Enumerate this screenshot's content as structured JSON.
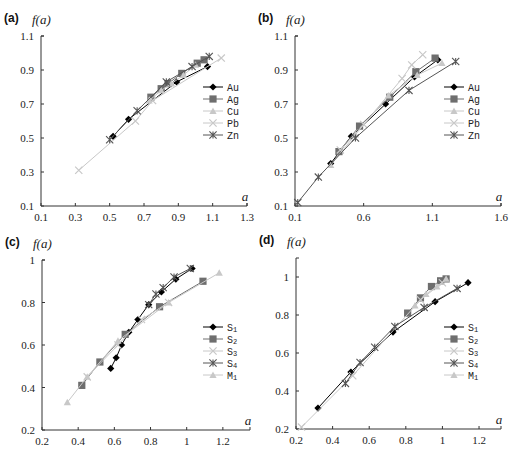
{
  "figure": {
    "panels_count": 4
  },
  "chart_data": [
    {
      "panel": "(a)",
      "type": "line",
      "title": "",
      "xlabel": "a",
      "ylabel": "f(a)",
      "xlim": [
        0.1,
        1.3
      ],
      "ylim": [
        0.1,
        1.1
      ],
      "xticks": [
        "0.1",
        "0.3",
        "0.5",
        "0.7",
        "0.9",
        "1.1",
        "1.3"
      ],
      "yticks": [
        "0.1",
        "0.3",
        "0.5",
        "0.7",
        "0.9",
        "1.1"
      ],
      "grid": false,
      "legend_position": "right-middle",
      "frame": {
        "x0": 41,
        "x1": 247,
        "y0": 206,
        "y1": 36
      },
      "legend": {
        "x": 203,
        "y": 87
      },
      "series": [
        {
          "name": "Au",
          "marker": "diamond",
          "color": "#000000",
          "x": [
            0.52,
            0.61,
            0.89,
            1.07
          ],
          "y": [
            0.51,
            0.61,
            0.83,
            0.92
          ]
        },
        {
          "name": "Ag",
          "marker": "square",
          "color": "#6e6e6e",
          "x": [
            0.74,
            0.8,
            0.84,
            0.92,
            1.01,
            1.05
          ],
          "y": [
            0.74,
            0.79,
            0.82,
            0.88,
            0.94,
            0.96
          ]
        },
        {
          "name": "Cu",
          "marker": "triangle",
          "color": "#c8c8c8",
          "x": [
            0.73,
            0.8,
            0.86,
            0.93,
            1.0
          ],
          "y": [
            0.72,
            0.78,
            0.82,
            0.87,
            0.93
          ]
        },
        {
          "name": "Pb",
          "marker": "x",
          "color": "#c8c8c8",
          "x": [
            0.32,
            0.65,
            0.75,
            1.15
          ],
          "y": [
            0.31,
            0.6,
            0.72,
            0.97
          ]
        },
        {
          "name": "Zn",
          "marker": "star",
          "color": "#555555",
          "x": [
            0.5,
            0.66,
            0.83,
            0.98,
            1.08
          ],
          "y": [
            0.49,
            0.66,
            0.83,
            0.92,
            0.98
          ]
        }
      ]
    },
    {
      "panel": "(b)",
      "type": "line",
      "title": "",
      "xlabel": "a",
      "ylabel": "f(a)",
      "xlim": [
        0.1,
        1.6
      ],
      "ylim": [
        0.1,
        1.1
      ],
      "xticks": [
        "0.1",
        "0.6",
        "1.1",
        "1.6"
      ],
      "yticks": [
        "0.1",
        "0.3",
        "0.5",
        "0.7",
        "0.9",
        "1.1"
      ],
      "grid": false,
      "legend_position": "right-middle",
      "frame": {
        "x0": 295,
        "x1": 501,
        "y0": 206,
        "y1": 36
      },
      "legend": {
        "x": 444,
        "y": 87
      },
      "series": [
        {
          "name": "Au",
          "marker": "diamond",
          "color": "#000000",
          "x": [
            0.36,
            0.51,
            0.76,
            0.97,
            1.14
          ],
          "y": [
            0.35,
            0.51,
            0.7,
            0.86,
            0.96
          ]
        },
        {
          "name": "Ag",
          "marker": "square",
          "color": "#6e6e6e",
          "x": [
            0.42,
            0.57,
            0.79,
            0.98,
            1.12
          ],
          "y": [
            0.42,
            0.57,
            0.74,
            0.89,
            0.97
          ]
        },
        {
          "name": "Cu",
          "marker": "triangle",
          "color": "#c8c8c8",
          "x": [
            0.36,
            0.54,
            0.78,
            0.99,
            1.17
          ],
          "y": [
            0.34,
            0.52,
            0.75,
            0.87,
            0.94
          ]
        },
        {
          "name": "Pb",
          "marker": "x",
          "color": "#c8c8c8",
          "x": [
            0.43,
            0.6,
            0.88,
            0.95,
            1.03
          ],
          "y": [
            0.43,
            0.58,
            0.85,
            0.93,
            0.99
          ]
        },
        {
          "name": "Zn",
          "marker": "star",
          "color": "#555555",
          "x": [
            0.12,
            0.27,
            0.54,
            0.93,
            1.27
          ],
          "y": [
            0.12,
            0.27,
            0.5,
            0.78,
            0.95
          ]
        }
      ]
    },
    {
      "panel": "(c)",
      "type": "line",
      "title": "",
      "xlabel": "a",
      "ylabel": "f(a)",
      "xlim": [
        0.2,
        1.35
      ],
      "ylim": [
        0.2,
        1.0
      ],
      "xticks": [
        "0.2",
        "0.4",
        "0.6",
        "0.8",
        "1",
        "1.2"
      ],
      "yticks": [
        "0.2",
        "0.4",
        "0.6",
        "0.8",
        "1"
      ],
      "grid": false,
      "legend_position": "right-middle",
      "frame": {
        "x0": 42,
        "x1": 250,
        "y0": 430,
        "y1": 260
      },
      "legend": {
        "x": 203,
        "y": 327
      },
      "series": [
        {
          "name": "S1",
          "marker": "diamond",
          "color": "#000000",
          "x": [
            0.58,
            0.61,
            0.64,
            0.68,
            0.73,
            0.79,
            0.86,
            0.94,
            1.03
          ],
          "y": [
            0.49,
            0.54,
            0.6,
            0.66,
            0.72,
            0.79,
            0.85,
            0.91,
            0.96
          ]
        },
        {
          "name": "S2",
          "marker": "square",
          "color": "#6e6e6e",
          "x": [
            0.42,
            0.52,
            0.66,
            0.85,
            1.09
          ],
          "y": [
            0.41,
            0.52,
            0.65,
            0.78,
            0.9
          ]
        },
        {
          "name": "S3",
          "marker": "x",
          "color": "#c8c8c8",
          "x": [
            0.45,
            0.62,
            0.75,
            0.9
          ],
          "y": [
            0.45,
            0.6,
            0.72,
            0.8
          ]
        },
        {
          "name": "S4",
          "marker": "star",
          "color": "#555555",
          "x": [
            0.79,
            0.83,
            0.87,
            0.93,
            1.02
          ],
          "y": [
            0.79,
            0.84,
            0.87,
            0.92,
            0.96
          ]
        },
        {
          "name": "M1",
          "marker": "triangle",
          "color": "#c8c8c8",
          "x": [
            0.34,
            0.45,
            0.62,
            0.9,
            1.18
          ],
          "y": [
            0.33,
            0.45,
            0.62,
            0.8,
            0.94
          ]
        }
      ]
    },
    {
      "panel": "(d)",
      "type": "line",
      "title": "",
      "xlabel": "a",
      "ylabel": "f(a)",
      "xlim": [
        0.2,
        1.32
      ],
      "ylim": [
        0.2,
        1.1
      ],
      "xticks": [
        "0.2",
        "0.4",
        "0.6",
        "0.8",
        "1",
        "1.2"
      ],
      "yticks": [
        "0.2",
        "0.4",
        "0.6",
        "0.8",
        "1"
      ],
      "grid": false,
      "legend_position": "right-middle",
      "frame": {
        "x0": 296,
        "x1": 501,
        "y0": 429,
        "y1": 258
      },
      "legend": {
        "x": 444,
        "y": 327
      },
      "series": [
        {
          "name": "S1",
          "marker": "diamond",
          "color": "#000000",
          "x": [
            0.32,
            0.5,
            0.73,
            0.96,
            1.14
          ],
          "y": [
            0.31,
            0.5,
            0.71,
            0.87,
            0.97
          ]
        },
        {
          "name": "S2",
          "marker": "square",
          "color": "#6e6e6e",
          "x": [
            0.81,
            0.88,
            0.94,
            0.99,
            1.02
          ],
          "y": [
            0.81,
            0.89,
            0.95,
            0.98,
            0.99
          ]
        },
        {
          "name": "S3",
          "marker": "x",
          "color": "#c8c8c8",
          "x": [
            0.23,
            0.51,
            0.88,
            1.0
          ],
          "y": [
            0.21,
            0.48,
            0.88,
            0.97
          ]
        },
        {
          "name": "S4",
          "marker": "star",
          "color": "#555555",
          "x": [
            0.47,
            0.55,
            0.63,
            0.74,
            0.9,
            1.08
          ],
          "y": [
            0.44,
            0.55,
            0.63,
            0.74,
            0.84,
            0.94
          ]
        },
        {
          "name": "M1",
          "marker": "triangle",
          "color": "#c8c8c8",
          "x": [
            0.85,
            0.91,
            0.97,
            1.02
          ],
          "y": [
            0.85,
            0.91,
            0.95,
            0.99
          ]
        }
      ]
    }
  ]
}
